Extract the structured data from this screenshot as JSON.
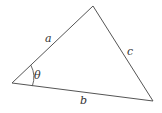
{
  "diagram": {
    "type": "triangle",
    "vertices": {
      "left": [
        12,
        83
      ],
      "top": [
        93,
        6
      ],
      "right": [
        153,
        101
      ]
    },
    "sides": [
      {
        "name": "a",
        "label": "a",
        "from": "left",
        "to": "top"
      },
      {
        "name": "c",
        "label": "c",
        "from": "top",
        "to": "right"
      },
      {
        "name": "b",
        "label": "b",
        "from": "left",
        "to": "right"
      }
    ],
    "angle": {
      "label": "θ",
      "at": "left"
    },
    "stroke_color": "#555555"
  }
}
